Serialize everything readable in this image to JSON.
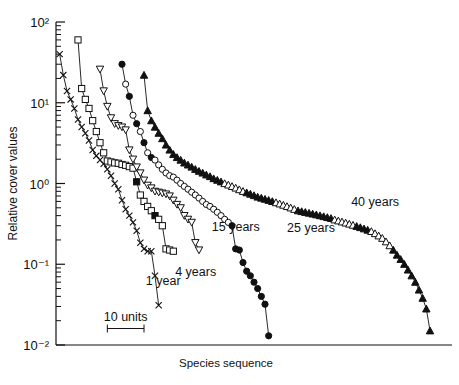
{
  "chart_data": {
    "type": "line",
    "title": "",
    "xlabel": "Species sequence",
    "ylabel": "Relative cover values",
    "yscale": "log",
    "ylim": [
      0.01,
      100
    ],
    "ytick_labels": [
      "10²",
      "10¹",
      "10⁰",
      "10⁻¹",
      "10⁻²"
    ],
    "ytick_values": [
      100,
      10,
      1,
      0.1,
      0.01
    ],
    "xlim": [
      0,
      108
    ],
    "xaxis_ticks": false,
    "grid": false,
    "legend_position": "inline-annotations",
    "scalebar": {
      "label": "10 units",
      "units": 10,
      "x_start": 14,
      "x_end": 24,
      "y": 0.016
    },
    "series": [
      {
        "name": "1 year",
        "marker": "x",
        "label": "1 year",
        "label_x": 24.5,
        "label_y": 0.055,
        "x": [
          1,
          2,
          3,
          4,
          5,
          6,
          7,
          8,
          9,
          10,
          11,
          12,
          13,
          14,
          15,
          16,
          17,
          18,
          19,
          20,
          21,
          22,
          23,
          24,
          25,
          26,
          27,
          28
        ],
        "y": [
          40,
          22,
          14,
          11,
          8.5,
          6.2,
          5.0,
          4.2,
          3.4,
          2.6,
          2.2,
          1.95,
          1.75,
          1.5,
          1.25,
          1.0,
          0.85,
          0.62,
          0.48,
          0.4,
          0.33,
          0.26,
          0.185,
          0.155,
          0.145,
          0.145,
          0.072,
          0.031
        ]
      },
      {
        "name": "4 years",
        "marker": "square",
        "label": "4 years",
        "label_x": 32.5,
        "label_y": 0.072,
        "x": [
          6,
          7,
          8,
          9,
          10,
          11,
          12,
          13,
          14,
          15,
          16,
          17,
          18,
          19,
          20,
          21,
          22,
          23,
          24,
          25,
          26,
          27,
          28,
          29,
          30,
          31,
          32
        ],
        "y": [
          60,
          15,
          11,
          8.5,
          6.0,
          4.4,
          3.2,
          2.4,
          1.9,
          1.85,
          1.8,
          1.78,
          1.72,
          1.68,
          1.62,
          1.55,
          1.05,
          0.72,
          0.6,
          0.52,
          0.46,
          0.4,
          0.36,
          0.3,
          0.155,
          0.15,
          0.145
        ],
        "filled_indices": [
          16,
          21
        ]
      },
      {
        "name": "15 years",
        "marker": "triangle-down",
        "label": "15 years",
        "label_x": 42.5,
        "label_y": 0.255,
        "x": [
          12,
          13,
          14,
          15,
          16,
          17,
          18,
          19,
          20,
          21,
          22,
          23,
          24,
          25,
          26,
          27,
          28,
          29,
          30,
          31,
          32,
          33,
          34,
          35,
          36,
          37,
          38,
          39
        ],
        "y": [
          26,
          14,
          9.0,
          6.5,
          5.5,
          5.2,
          5.0,
          4.6,
          2.6,
          2.0,
          1.6,
          1.35,
          1.1,
          0.95,
          0.88,
          0.8,
          0.78,
          0.76,
          0.74,
          0.7,
          0.62,
          0.55,
          0.5,
          0.4,
          0.36,
          0.33,
          0.185,
          0.15
        ]
      },
      {
        "name": "25 years",
        "marker": "circle",
        "label": "25 years",
        "label_x": 63.0,
        "label_y": 0.25,
        "x": [
          18,
          19,
          20,
          21,
          22,
          23,
          24,
          25,
          26,
          27,
          28,
          29,
          30,
          31,
          32,
          33,
          34,
          35,
          36,
          37,
          38,
          39,
          40,
          41,
          42,
          43,
          44,
          45,
          46,
          47,
          48,
          49,
          50,
          51,
          52,
          53,
          54,
          55,
          56,
          57,
          58
        ],
        "y": [
          30,
          17,
          12,
          7.0,
          5.5,
          4.4,
          3.2,
          2.4,
          2.1,
          1.95,
          1.7,
          1.5,
          1.35,
          1.25,
          1.2,
          1.1,
          1.0,
          0.92,
          0.85,
          0.78,
          0.72,
          0.66,
          0.6,
          0.55,
          0.52,
          0.48,
          0.44,
          0.4,
          0.36,
          0.33,
          0.3,
          0.155,
          0.15,
          0.105,
          0.082,
          0.072,
          0.06,
          0.05,
          0.04,
          0.032,
          0.013
        ],
        "filled_indices": [
          0,
          2,
          4,
          6,
          8,
          30,
          31,
          32,
          33,
          34,
          35,
          36,
          37,
          38,
          39,
          40
        ]
      },
      {
        "name": "40 years",
        "marker": "triangle-up",
        "label": "40 years",
        "label_x": 80.5,
        "label_y": 0.52,
        "x": [
          24,
          25,
          26,
          27,
          28,
          29,
          30,
          31,
          32,
          33,
          34,
          35,
          36,
          37,
          38,
          39,
          40,
          41,
          42,
          43,
          44,
          45,
          46,
          47,
          48,
          49,
          50,
          51,
          52,
          53,
          54,
          55,
          56,
          57,
          58,
          59,
          60,
          61,
          62,
          63,
          64,
          65,
          66,
          67,
          68,
          69,
          70,
          71,
          72,
          73,
          74,
          75,
          76,
          77,
          78,
          79,
          80,
          81,
          82,
          83,
          84,
          85,
          86,
          87,
          88,
          89,
          90,
          91,
          92,
          93,
          94,
          95,
          96,
          97,
          98,
          99,
          100,
          101,
          102
        ],
        "y": [
          22,
          8.0,
          6.0,
          5.0,
          4.2,
          3.6,
          3.0,
          2.6,
          2.3,
          2.1,
          1.95,
          1.8,
          1.7,
          1.6,
          1.5,
          1.42,
          1.35,
          1.28,
          1.22,
          1.15,
          1.1,
          1.05,
          1.0,
          0.96,
          0.92,
          0.88,
          0.84,
          0.8,
          0.77,
          0.74,
          0.71,
          0.68,
          0.66,
          0.64,
          0.62,
          0.6,
          0.58,
          0.56,
          0.54,
          0.52,
          0.5,
          0.48,
          0.46,
          0.45,
          0.44,
          0.43,
          0.42,
          0.41,
          0.4,
          0.39,
          0.38,
          0.37,
          0.355,
          0.345,
          0.335,
          0.325,
          0.315,
          0.305,
          0.295,
          0.285,
          0.275,
          0.265,
          0.255,
          0.24,
          0.225,
          0.21,
          0.19,
          0.17,
          0.15,
          0.13,
          0.115,
          0.1,
          0.085,
          0.072,
          0.06,
          0.048,
          0.038,
          0.028,
          0.015
        ],
        "filled_indices": [
          0,
          1,
          2,
          3,
          4,
          5,
          6,
          7,
          8,
          9,
          10,
          11,
          12,
          13,
          14,
          15,
          16,
          17,
          18,
          19,
          20,
          21,
          28,
          29,
          30,
          31,
          32,
          33,
          34,
          35,
          42,
          43,
          44,
          45,
          46,
          47,
          48,
          49,
          50,
          51,
          58,
          59,
          60,
          61,
          68,
          69,
          70,
          71,
          72,
          73,
          74,
          75,
          76,
          77,
          78
        ]
      }
    ]
  },
  "axis": {
    "ylabel": "Relative cover values",
    "xlabel": "Species sequence",
    "ticks": [
      "10²",
      "10¹",
      "10⁰",
      "10⁻¹",
      "10⁻²"
    ]
  },
  "annotations": {
    "scalebar_label": "10 units",
    "series_labels": [
      "1 year",
      "4 years",
      "15 years",
      "25 years",
      "40 years"
    ]
  }
}
